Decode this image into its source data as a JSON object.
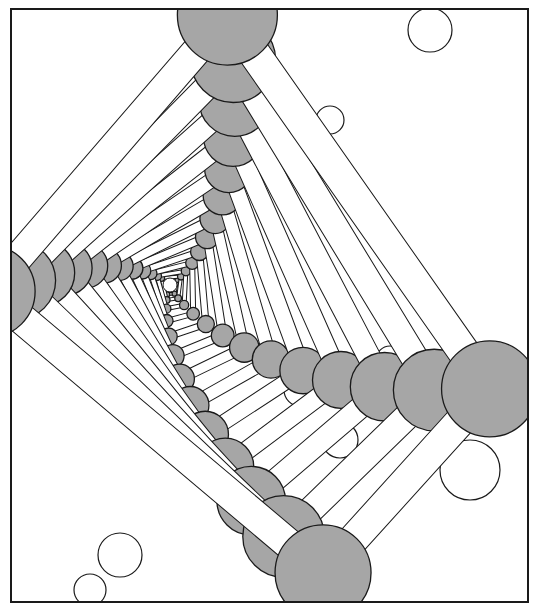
{
  "illustration": {
    "subject": "perspective view down a molecular tunnel (ball-and-stick model)",
    "frame": {
      "x": 11,
      "y": 9,
      "width": 517,
      "height": 593
    },
    "vanishing_point": {
      "x": 170,
      "y": 285
    },
    "colors": {
      "background": "#ffffff",
      "stroke": "#1a1a1a",
      "dark_atom": "#a6a6a6",
      "light_atom": "#ffffff",
      "rod": "#ffffff"
    },
    "arms": [
      {
        "name": "up",
        "angle_deg": -78,
        "max_radius": 48,
        "max_dist": 270
      },
      {
        "name": "right",
        "angle_deg": 18,
        "max_radius": 46,
        "max_dist": 330
      },
      {
        "name": "down",
        "angle_deg": 62,
        "max_radius": 46,
        "max_dist": 320
      },
      {
        "name": "left",
        "angle_deg": 178,
        "max_radius": 44,
        "max_dist": 175
      }
    ],
    "steps": 14
  }
}
